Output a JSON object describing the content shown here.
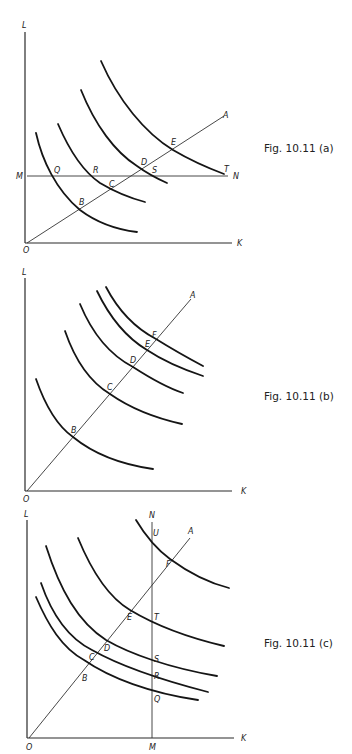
{
  "figures": [
    {
      "id": "a",
      "caption": "Fig. 10.11 (a)",
      "axis_labels": {
        "y": "L",
        "x": "K",
        "origin": "O"
      },
      "horizontal_line": {
        "left_label": "M",
        "right_label": "N"
      },
      "ray_label": "A",
      "point_labels": {
        "Q": "Q",
        "R": "R",
        "C": "C",
        "B": "B",
        "D": "D",
        "S": "S",
        "E": "E",
        "T": "T"
      },
      "isoquant_count": 4
    },
    {
      "id": "b",
      "caption": "Fig. 10.11 (b)",
      "axis_labels": {
        "y": "L",
        "x": "K",
        "origin": "O"
      },
      "ray_label": "A",
      "point_labels": {
        "B": "B",
        "C": "C",
        "D": "D",
        "E": "E",
        "F": "F"
      },
      "isoquant_count": 5
    },
    {
      "id": "c",
      "caption": "Fig. 10.11 (c)",
      "axis_labels": {
        "y": "L",
        "x": "K",
        "origin": "O"
      },
      "vertical_line": {
        "top_label": "N",
        "bottom_label": "M"
      },
      "ray_label": "A",
      "point_labels": {
        "B": "B",
        "C": "C",
        "D": "D",
        "E": "E",
        "F": "F",
        "U": "U",
        "T": "T",
        "S": "S",
        "R": "R",
        "Q": "Q"
      },
      "isoquant_count": 5
    }
  ],
  "colors": {
    "ink": "#151515",
    "background": "#ffffff"
  }
}
